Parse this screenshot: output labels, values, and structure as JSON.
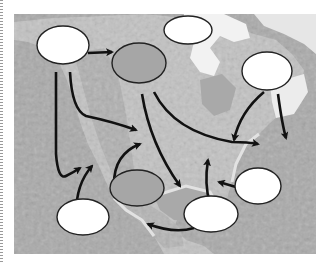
{
  "diagram": {
    "type": "map-diagram",
    "colors": {
      "ocean": "#a9a9a9",
      "land": "#c4c4c4",
      "ice": "#f0f0f0",
      "oval_white_fill": "#ffffff",
      "oval_gray_fill": "#a6a6a6",
      "oval_stroke": "#222222",
      "arrow": "#111111"
    },
    "ovals": [
      {
        "id": "oval-northwest",
        "fill": "white",
        "label": ""
      },
      {
        "id": "oval-north",
        "fill": "white",
        "label": ""
      },
      {
        "id": "oval-central-north",
        "fill": "gray",
        "label": ""
      },
      {
        "id": "oval-northeast",
        "fill": "white",
        "label": ""
      },
      {
        "id": "oval-east-atlantic",
        "fill": "white",
        "label": ""
      },
      {
        "id": "oval-southwest-pacific",
        "fill": "white",
        "label": ""
      },
      {
        "id": "oval-south-central",
        "fill": "gray",
        "label": ""
      },
      {
        "id": "oval-gulf",
        "fill": "white",
        "label": ""
      }
    ],
    "arrows_count": 12
  }
}
